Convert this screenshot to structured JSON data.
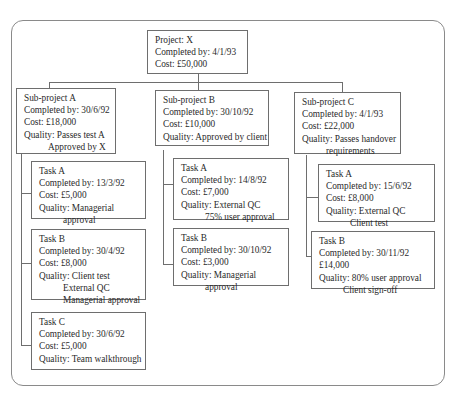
{
  "project": {
    "title": "Project: X",
    "completed": "Completed by: 4/1/93",
    "cost": "Cost: £50,000"
  },
  "subprojects": [
    {
      "title": "Sub-project A",
      "completed": "Completed by: 30/6/92",
      "cost": "Cost: £18,000",
      "quality": [
        "Quality: Passes test A",
        "Approved by X"
      ],
      "tasks": [
        {
          "title": "Task A",
          "completed": "Completed by: 13/3/92",
          "cost": "Cost: £5,000",
          "quality": [
            "Quality: Managerial",
            "approval"
          ]
        },
        {
          "title": "Task B",
          "completed": "Completed by: 30/4/92",
          "cost": "Cost: £8,000",
          "quality": [
            "Quality: Client test",
            "External QC",
            "Managerial approval"
          ]
        },
        {
          "title": "Task C",
          "completed": "Completed by: 30/6/92",
          "cost": "Cost: £5,000",
          "quality": [
            "Quality: Team walkthrough"
          ]
        }
      ]
    },
    {
      "title": "Sub-project B",
      "completed": "Completed by: 30/10/92",
      "cost": "Cost: £10,000",
      "quality": [
        "Quality: Approved by client"
      ],
      "tasks": [
        {
          "title": "Task A",
          "completed": "Completed by: 14/8/92",
          "cost": "Cost: £7,000",
          "quality": [
            "Quality: External QC",
            "75% user approval"
          ]
        },
        {
          "title": "Task B",
          "completed": "Completed by: 30/10/92",
          "cost": "Cost: £3,000",
          "quality": [
            "Quality: Managerial",
            "approval"
          ]
        }
      ]
    },
    {
      "title": "Sub-project C",
      "completed": "Completed by: 4/1/93",
      "cost": "Cost: £22,000",
      "quality": [
        "Quality: Passes handover",
        "requirements"
      ],
      "tasks": [
        {
          "title": "Task A",
          "completed": "Completed by: 15/6/92",
          "cost": "Cost: £8,000",
          "quality": [
            "Quality: External QC",
            "Client test"
          ]
        },
        {
          "title": "Task B",
          "completed": "Completed by: 30/11/92",
          "cost": "£14,000",
          "quality": [
            "Quality: 80% user approval",
            "Client sign-off"
          ]
        }
      ]
    }
  ]
}
